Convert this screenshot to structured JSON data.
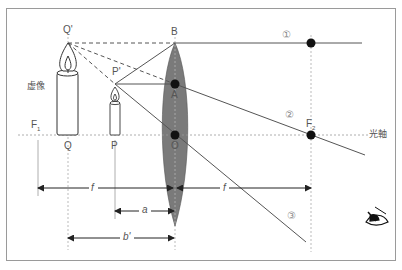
{
  "figure": {
    "type": "convex-lens-virtual-image",
    "points": {
      "Q_prime": "Q'",
      "P_prime": "P'",
      "B": "B",
      "A": "A",
      "O": "O",
      "P": "P",
      "Q": "Q",
      "F1": "F",
      "F1_sub": "1",
      "F2": "F",
      "F2_sub": "2"
    },
    "labels": {
      "virtual_image": "虚像",
      "optical_axis": "光軸"
    },
    "rays": [
      {
        "id": "1",
        "label": "①",
        "description": "parallel ray from B, refracted through F2"
      },
      {
        "id": "2",
        "label": "②",
        "description": "ray from A through F2"
      },
      {
        "id": "3",
        "label": "③",
        "description": "ray from P' through lens center O"
      }
    ],
    "dimensions": {
      "f_left": "f",
      "f_right": "f",
      "a": "a",
      "b_prime": "b'"
    },
    "colors": {
      "lens_fill": "#7a7a7a",
      "ray": "#555555",
      "dashed": "#555555",
      "dot": "#111111",
      "guide": "#aaaaaa",
      "frame": "#9a9a9a"
    },
    "icons": {
      "observer": "eye-icon"
    }
  }
}
